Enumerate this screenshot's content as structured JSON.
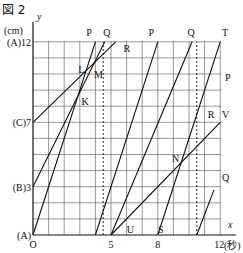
{
  "figure": {
    "title": "図 2",
    "y_axis_var": "y",
    "y_unit": "(cm)",
    "x_axis_var": "x",
    "x_unit": "(秒)",
    "y_tick_labels": [
      {
        "label": "(A)12",
        "value": 12
      },
      {
        "label": "(C)7",
        "value": 7
      },
      {
        "label": "(B)3",
        "value": 3
      },
      {
        "label": "(A)",
        "value": 0
      }
    ],
    "x_tick_labels": [
      {
        "label": "O",
        "value": 0
      },
      {
        "label": "5",
        "value": 5
      },
      {
        "label": "8",
        "value": 8
      },
      {
        "label": "12",
        "value": 12
      }
    ],
    "grid": {
      "x_max": 12,
      "y_max": 12,
      "step": 1
    },
    "segments": [
      {
        "name": "O-P",
        "from": [
          0,
          0
        ],
        "to": [
          4,
          12
        ]
      },
      {
        "name": "B-Q",
        "from": [
          0,
          3
        ],
        "to": [
          4.6,
          12
        ]
      },
      {
        "name": "C-R",
        "from": [
          0,
          7
        ],
        "to": [
          5.3,
          12
        ]
      },
      {
        "name": "4-P",
        "from": [
          4,
          0
        ],
        "to": [
          8,
          12
        ]
      },
      {
        "name": "5-Q",
        "from": [
          5,
          0
        ],
        "to": [
          10.2,
          12
        ]
      },
      {
        "name": "U-V",
        "from": [
          5,
          0
        ],
        "to": [
          12,
          7
        ]
      },
      {
        "name": "S-T",
        "from": [
          8,
          0
        ],
        "to": [
          12,
          12
        ]
      },
      {
        "name": "10.5-Q",
        "from": [
          10.5,
          0
        ],
        "to": [
          11.6,
          2.8
        ]
      }
    ],
    "dashed_lines": [
      {
        "x": 4.5
      },
      {
        "x": 10.5
      }
    ],
    "point_labels": [
      {
        "label": "P",
        "x": 3.6,
        "y": 12.6
      },
      {
        "label": "Q",
        "x": 4.7,
        "y": 12.6
      },
      {
        "label": "R",
        "x": 6.0,
        "y": 11.6
      },
      {
        "label": "L",
        "x": 3.1,
        "y": 10.3
      },
      {
        "label": "M",
        "x": 4.1,
        "y": 10.0
      },
      {
        "label": "K",
        "x": 3.3,
        "y": 8.3
      },
      {
        "label": "P",
        "x": 7.6,
        "y": 12.6
      },
      {
        "label": "Q",
        "x": 10.1,
        "y": 12.6
      },
      {
        "label": "T",
        "x": 12.3,
        "y": 12.6
      },
      {
        "label": "P",
        "x": 12.5,
        "y": 9.8
      },
      {
        "label": "R",
        "x": 11.4,
        "y": 7.5
      },
      {
        "label": "V",
        "x": 12.3,
        "y": 7.5
      },
      {
        "label": "N",
        "x": 9.1,
        "y": 4.8
      },
      {
        "label": "Q",
        "x": 12.3,
        "y": 3.6
      },
      {
        "label": "U",
        "x": 6.2,
        "y": 0.4
      },
      {
        "label": "S",
        "x": 8.2,
        "y": 0.4
      }
    ]
  }
}
